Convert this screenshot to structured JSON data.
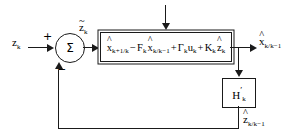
{
  "diagram": {
    "type": "control-block-diagram",
    "line_color": "#1a1a1a",
    "background": "#ffffff"
  },
  "signals": {
    "input_measurement": {
      "base": "z",
      "sub": "k",
      "hat": "",
      "text": "z_k"
    },
    "innovation": {
      "base": "z",
      "sub": "k",
      "hat": "~",
      "text": "z̃_k"
    },
    "state_output": {
      "base": "x",
      "sub": "k/k−1",
      "hat": "^",
      "text": "x̂_k/k−1"
    },
    "feedback_estimate": {
      "base": "z",
      "sub": "k/k−1",
      "hat": "^",
      "text": "ẑ_k/k−1"
    }
  },
  "signs": {
    "positive": "+",
    "negative": "−"
  },
  "summing_junction": {
    "symbol": "Σ",
    "name": "summing-junction"
  },
  "main_block": {
    "name": "state-prediction-block",
    "equation_parts": [
      {
        "hat": "^",
        "base": "x",
        "sub": "k+1/k"
      },
      {
        "op": "−",
        "base": "F",
        "sub": "k"
      },
      {
        "hat": "^",
        "base": "x",
        "sub": "k/k−1"
      },
      {
        "op": "+",
        "base": "Γ",
        "sub": "k"
      },
      {
        "base": "u",
        "sub": "k"
      },
      {
        "op": "+",
        "base": "K",
        "sub": "k"
      },
      {
        "hat": "^",
        "base": "z",
        "sub": "k"
      }
    ],
    "equation_text": "x̂_k+1/k − F_k x̂_k/k−1 + Γ_k u_k + K_k ẑ_k"
  },
  "gain_block": {
    "name": "measurement-matrix-block",
    "base": "H",
    "prime": "′",
    "sub": "k",
    "text": "H′_k"
  },
  "arrows": {
    "top_input": {
      "name": "top-input-arrow",
      "label": ""
    }
  }
}
